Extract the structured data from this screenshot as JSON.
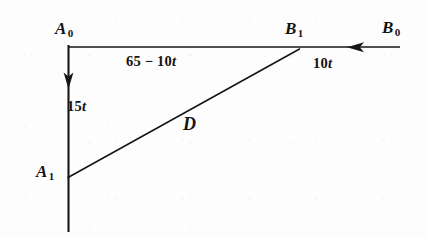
{
  "figure": {
    "type": "vector-diagram",
    "background_color": "#fdfdfd",
    "ink_color": "#161616",
    "width": 427,
    "height": 238
  },
  "points": {
    "A0": {
      "label_base": "A",
      "label_sub": "0",
      "x": 68,
      "y": 45
    },
    "A1": {
      "label_base": "A",
      "label_sub": "1",
      "x": 68,
      "y": 177
    },
    "B1": {
      "label_base": "B",
      "label_sub": "1",
      "x": 298,
      "y": 50
    },
    "B0": {
      "label_base": "B",
      "label_sub": "0",
      "x": 400,
      "y": 46
    }
  },
  "segments": {
    "top": {
      "name": "A0-to-B1-horizontal",
      "label_text": "65 − 10",
      "label_var": "t",
      "from": "A0",
      "to": "B1"
    },
    "left": {
      "name": "A0-to-A1-vertical",
      "label_text": "15",
      "label_var": "t",
      "from": "A0",
      "to": "A1",
      "arrow": "down"
    },
    "right": {
      "name": "B0-to-B1-horizontal",
      "label_text": "10",
      "label_var": "t",
      "from": "B0",
      "to": "B1",
      "arrow": "left"
    },
    "diagonal": {
      "name": "A1-to-B1-distance",
      "label_text": "D",
      "from": "A1",
      "to": "B1"
    }
  },
  "geometry": {
    "horizontal_line_y": 47,
    "horizontal_line_x_start": 68,
    "horizontal_line_x_end": 400,
    "vertical_line_x": 68,
    "vertical_line_y_start": 45,
    "vertical_line_y_end": 232,
    "down_arrow_tip_y": 88,
    "left_arrow_tip_x": 348,
    "diagonal_from": [
      68,
      177
    ],
    "diagonal_to": [
      299,
      49
    ]
  }
}
